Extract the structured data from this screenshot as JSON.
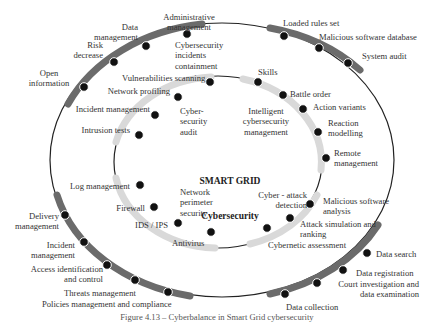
{
  "center": {
    "title_line1": "SMART GRID",
    "title_line2": "Cybersecurity"
  },
  "colors": {
    "outer_band": "#6b6b6b",
    "inner_band": "#d9d9d9",
    "dot": "#111111",
    "line": "#222222",
    "text": "#333333"
  },
  "outer_ring": {
    "labels": [
      "Administrative\nmanagement",
      "Data\nmanagement",
      "Risk\ndecrease",
      "Open\ninformation",
      "Loaded rules set",
      "Malicious software database",
      "System audit",
      "Delivery\nmanagement",
      "Incident\nmanagement",
      "Access identification\nand control",
      "Threats management",
      "Policies management and compliance",
      "Data search",
      "Data registration",
      "Court investigation and\ndata examination",
      "Data collection"
    ]
  },
  "inner_ring": {
    "labels": [
      "Cybersecurity\nincidents\ncontainment",
      "Vulnerabilities scanning",
      "Network profiling",
      "Incident management",
      "Intrusion tests",
      "Log management",
      "Firewall",
      "IDS / IPS",
      "Antivirus",
      "Skills",
      "Battle order",
      "Action variants",
      "Reaction\nmodelling",
      "Remote\nmanagement",
      "Malicious software\nanalysis",
      "Attack simulation and\nranking",
      "Cybernetic assessment"
    ],
    "quadrants": [
      "Cyber-\nsecurity\naudit",
      "Intelligent\ncybersecurity\nmanagement",
      "Network\nperimeter\nsecurity",
      "Cyber - attack\ndetection"
    ]
  },
  "caption": "Figure 4.13 – Cyberbalance in Smart Grid cybersecurity"
}
